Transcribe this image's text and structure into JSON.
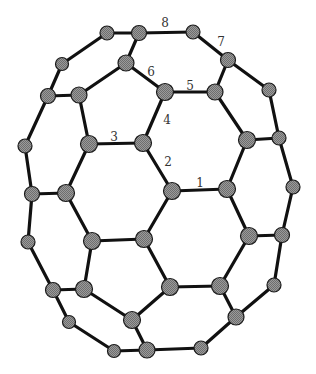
{
  "diagram": {
    "title": "",
    "type": "molecular-structure",
    "colors": {
      "bond": "#111111",
      "atom_fill": "#8c8c8c",
      "atom_stroke": "#1a1a1a",
      "label": "#333333",
      "background": "#ffffff"
    },
    "atoms": [
      {
        "id": "A",
        "x": 107,
        "y": 33,
        "r": 7
      },
      {
        "id": "B",
        "x": 139,
        "y": 33,
        "r": 7.5
      },
      {
        "id": "C",
        "x": 193,
        "y": 32,
        "r": 7
      },
      {
        "id": "D",
        "x": 228,
        "y": 60,
        "r": 7.5
      },
      {
        "id": "E",
        "x": 62,
        "y": 64,
        "r": 6.5
      },
      {
        "id": "F",
        "x": 126,
        "y": 63,
        "r": 8
      },
      {
        "id": "G",
        "x": 269,
        "y": 90,
        "r": 7
      },
      {
        "id": "H",
        "x": 48,
        "y": 96,
        "r": 7.5
      },
      {
        "id": "I",
        "x": 79,
        "y": 95,
        "r": 8
      },
      {
        "id": "J",
        "x": 165,
        "y": 92,
        "r": 8.5
      },
      {
        "id": "K",
        "x": 215,
        "y": 92,
        "r": 8
      },
      {
        "id": "L",
        "x": 25,
        "y": 146,
        "r": 7
      },
      {
        "id": "M",
        "x": 89,
        "y": 144,
        "r": 8.5
      },
      {
        "id": "N",
        "x": 143,
        "y": 143,
        "r": 8.5
      },
      {
        "id": "O",
        "x": 247,
        "y": 140,
        "r": 8.5
      },
      {
        "id": "P",
        "x": 279,
        "y": 138,
        "r": 7
      },
      {
        "id": "Q",
        "x": 32,
        "y": 194,
        "r": 7.5
      },
      {
        "id": "R",
        "x": 66,
        "y": 193,
        "r": 8.5
      },
      {
        "id": "S",
        "x": 172,
        "y": 191,
        "r": 8.5
      },
      {
        "id": "T",
        "x": 227,
        "y": 189,
        "r": 8.5
      },
      {
        "id": "U",
        "x": 293,
        "y": 187,
        "r": 7
      },
      {
        "id": "V",
        "x": 28,
        "y": 242,
        "r": 7
      },
      {
        "id": "W",
        "x": 92,
        "y": 241,
        "r": 8.5
      },
      {
        "id": "X",
        "x": 144,
        "y": 239,
        "r": 8.5
      },
      {
        "id": "Y",
        "x": 249,
        "y": 236,
        "r": 8.5
      },
      {
        "id": "Z",
        "x": 282,
        "y": 235,
        "r": 7.5
      },
      {
        "id": "a",
        "x": 274,
        "y": 285,
        "r": 7
      },
      {
        "id": "b",
        "x": 53,
        "y": 290,
        "r": 7.5
      },
      {
        "id": "c",
        "x": 84,
        "y": 289,
        "r": 8.5
      },
      {
        "id": "d",
        "x": 170,
        "y": 287,
        "r": 8.5
      },
      {
        "id": "e",
        "x": 220,
        "y": 286,
        "r": 8.5
      },
      {
        "id": "f",
        "x": 69,
        "y": 322,
        "r": 6.5
      },
      {
        "id": "g",
        "x": 132,
        "y": 320,
        "r": 8.5
      },
      {
        "id": "h",
        "x": 236,
        "y": 317,
        "r": 8
      },
      {
        "id": "i",
        "x": 114,
        "y": 351,
        "r": 6.5
      },
      {
        "id": "j",
        "x": 147,
        "y": 350,
        "r": 8
      },
      {
        "id": "k",
        "x": 201,
        "y": 348,
        "r": 7
      }
    ],
    "bonds": [
      [
        "A",
        "B"
      ],
      [
        "A",
        "E"
      ],
      [
        "E",
        "H"
      ],
      [
        "H",
        "I"
      ],
      [
        "I",
        "F"
      ],
      [
        "F",
        "B"
      ],
      [
        "F",
        "J"
      ],
      [
        "B",
        "C"
      ],
      [
        "C",
        "D"
      ],
      [
        "D",
        "K"
      ],
      [
        "D",
        "G"
      ],
      [
        "J",
        "K"
      ],
      [
        "J",
        "N"
      ],
      [
        "I",
        "M"
      ],
      [
        "M",
        "N"
      ],
      [
        "H",
        "L"
      ],
      [
        "L",
        "Q"
      ],
      [
        "Q",
        "R"
      ],
      [
        "R",
        "M"
      ],
      [
        "K",
        "O"
      ],
      [
        "G",
        "P"
      ],
      [
        "O",
        "P"
      ],
      [
        "O",
        "T"
      ],
      [
        "P",
        "U"
      ],
      [
        "N",
        "S"
      ],
      [
        "S",
        "T"
      ],
      [
        "S",
        "X"
      ],
      [
        "R",
        "W"
      ],
      [
        "W",
        "X"
      ],
      [
        "Q",
        "V"
      ],
      [
        "T",
        "Y"
      ],
      [
        "Y",
        "Z"
      ],
      [
        "U",
        "Z"
      ],
      [
        "Y",
        "e"
      ],
      [
        "Z",
        "a"
      ],
      [
        "V",
        "b"
      ],
      [
        "b",
        "c"
      ],
      [
        "W",
        "c"
      ],
      [
        "X",
        "d"
      ],
      [
        "d",
        "e"
      ],
      [
        "c",
        "g"
      ],
      [
        "d",
        "g"
      ],
      [
        "g",
        "j"
      ],
      [
        "b",
        "f"
      ],
      [
        "f",
        "i"
      ],
      [
        "i",
        "j"
      ],
      [
        "e",
        "h"
      ],
      [
        "a",
        "h"
      ],
      [
        "h",
        "k"
      ],
      [
        "j",
        "k"
      ]
    ],
    "labels": [
      {
        "text": "1",
        "x": 200,
        "y": 183
      },
      {
        "text": "2",
        "x": 168,
        "y": 162
      },
      {
        "text": "3",
        "x": 114,
        "y": 137
      },
      {
        "text": "4",
        "x": 167,
        "y": 120
      },
      {
        "text": "5",
        "x": 190,
        "y": 86
      },
      {
        "text": "6",
        "x": 151,
        "y": 72
      },
      {
        "text": "7",
        "x": 221,
        "y": 42
      },
      {
        "text": "8",
        "x": 165,
        "y": 23
      }
    ]
  }
}
